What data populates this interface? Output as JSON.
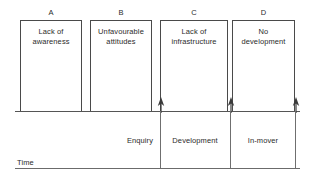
{
  "diagram": {
    "colors": {
      "line": "#4a4a4a",
      "axis": "#555555",
      "text": "#2b2b2b",
      "background": "#ffffff"
    },
    "stages": [
      {
        "letter": "A",
        "barrier": "Lack of\nawareness",
        "x": 20,
        "width": 62
      },
      {
        "letter": "B",
        "barrier": "Unfavourable\nattitudes",
        "x": 90,
        "width": 62
      },
      {
        "letter": "C",
        "barrier": "Lack of\ninfrastructure",
        "x": 160,
        "width": 68
      },
      {
        "letter": "D",
        "barrier": "No\ndevelopment",
        "x": 232,
        "width": 63
      }
    ],
    "phases": [
      {
        "label": "Enquiry",
        "x": 120,
        "width": 40
      },
      {
        "label": "Development",
        "x": 161,
        "width": 68
      },
      {
        "label": "In-mover",
        "x": 231,
        "width": 64
      }
    ],
    "axis": {
      "time_label": "Time"
    },
    "markers": [
      {
        "name": "enquiry-marker",
        "x": 160
      },
      {
        "name": "development-marker",
        "x": 230
      },
      {
        "name": "in-mover-marker",
        "x": 295
      }
    ]
  }
}
